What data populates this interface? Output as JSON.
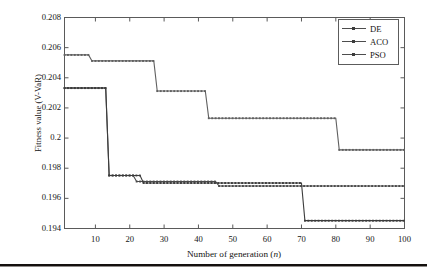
{
  "chart_data": {
    "type": "line",
    "title": "",
    "subtitle": "",
    "xlabel": "Number of generation (n)",
    "ylabel": "Fitness value (V-VaR)",
    "xlim": [
      1,
      100
    ],
    "ylim": [
      0.194,
      0.208
    ],
    "xticks": [
      10,
      20,
      30,
      40,
      50,
      60,
      70,
      80,
      90,
      100
    ],
    "yticks": [
      0.194,
      0.196,
      0.198,
      0.2,
      0.202,
      0.204,
      0.206,
      0.208
    ],
    "ytick_labels": [
      "0.194",
      "0.196",
      "0.198",
      "0.2",
      "0.202",
      "0.204",
      "0.206",
      "0.208"
    ],
    "xtick_labels": [
      "10",
      "20",
      "30",
      "40",
      "50",
      "60",
      "70",
      "80",
      "90",
      "100"
    ],
    "grid": false,
    "legend_position": "top-right",
    "step_style": "post",
    "series": [
      {
        "name": "DE",
        "color": "#4a4a4a",
        "marker": "square",
        "x": [
          1,
          13,
          14,
          21,
          22,
          45,
          46,
          100
        ],
        "values": [
          0.20332,
          0.20332,
          0.19752,
          0.19752,
          0.19712,
          0.19712,
          0.19682,
          0.19682
        ]
      },
      {
        "name": "ACO",
        "color": "#606060",
        "marker": "square",
        "x": [
          1,
          8,
          9,
          27,
          28,
          42,
          43,
          80,
          81,
          100
        ],
        "values": [
          0.20552,
          0.20552,
          0.20512,
          0.20512,
          0.20312,
          0.20312,
          0.20132,
          0.20132,
          0.19922,
          0.19922
        ]
      },
      {
        "name": "PSO",
        "color": "#3c3c3c",
        "marker": "square",
        "x": [
          1,
          13,
          14,
          23,
          24,
          70,
          71,
          100
        ],
        "values": [
          0.20332,
          0.20332,
          0.19752,
          0.19752,
          0.19702,
          0.19702,
          0.19452,
          0.19452
        ]
      }
    ]
  },
  "legend": {
    "entries": [
      {
        "label": "DE"
      },
      {
        "label": "ACO"
      },
      {
        "label": "PSO"
      }
    ]
  },
  "axis": {
    "xlabel_prefix": "Number of generation (",
    "xlabel_italic": "n",
    "xlabel_suffix": ")",
    "ylabel_text": "Fitness value (V-VaR)"
  }
}
